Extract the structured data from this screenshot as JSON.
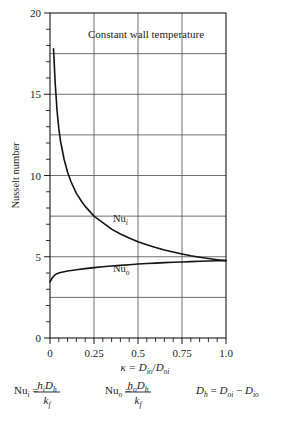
{
  "figure": {
    "annotation": "Constant wall temperature",
    "y_axis_title": "Nusselt number",
    "x_axis_caption": {
      "symbol": "κ",
      "equals": "=",
      "numerator": "D",
      "numerator_sub": "io",
      "slash": "/",
      "denominator": "D",
      "denominator_sub": "oi"
    },
    "curve_labels": {
      "inner": "Nu",
      "inner_sub": "i",
      "outer": "Nu",
      "outer_sub": "o"
    },
    "formulas": [
      {
        "lhs": "Nu",
        "lhs_sub": "i",
        "eq": "=",
        "num_a": "h",
        "num_a_sub": "i",
        "num_b": "D",
        "num_b_sub": "h",
        "den": "k",
        "den_sub": "f"
      },
      {
        "lhs": "Nu",
        "lhs_sub": "o",
        "eq": "=",
        "num_a": "h",
        "num_a_sub": "o",
        "num_b": "D",
        "num_b_sub": "h",
        "den": "k",
        "den_sub": "f"
      }
    ],
    "hydraulic_formula": {
      "lhs": "D",
      "lhs_sub": "h",
      "eq": "=",
      "term1": "D",
      "term1_sub": "oi",
      "minus": "−",
      "term2": "D",
      "term2_sub": "io"
    }
  },
  "chart_data": {
    "type": "line",
    "title": "",
    "annotation": "Constant wall temperature",
    "xlabel": "κ = D_io/D_oi",
    "ylabel": "Nusselt number",
    "xlim": [
      0,
      1.0
    ],
    "ylim": [
      0,
      20
    ],
    "xticks": [
      0,
      0.25,
      0.5,
      0.75,
      1.0
    ],
    "xtick_labels": [
      "0",
      "0.25",
      "0.5",
      "0.75",
      "1.0"
    ],
    "yticks": [
      0,
      5,
      10,
      15,
      20
    ],
    "ytick_labels": [
      "0",
      "5",
      "10",
      "15",
      "20"
    ],
    "x_minor_tick_step": 0.05,
    "y_minor_tick_step": 1,
    "grid": true,
    "grid_x_values": [
      0.25,
      0.5,
      0.75
    ],
    "grid_y_values": [
      2.5,
      5,
      7.5,
      10,
      12.5,
      15,
      17.5
    ],
    "legend_position": "inline-labels",
    "series": [
      {
        "name": "Nu_i",
        "label": "Nu",
        "label_sub": "i",
        "x": [
          0.02,
          0.03,
          0.04,
          0.05,
          0.06,
          0.08,
          0.1,
          0.12,
          0.15,
          0.18,
          0.2,
          0.25,
          0.3,
          0.35,
          0.4,
          0.45,
          0.5,
          0.55,
          0.6,
          0.65,
          0.7,
          0.75,
          0.8,
          0.85,
          0.9,
          0.95,
          1.0
        ],
        "y": [
          17.8,
          15.6,
          14.0,
          12.9,
          12.1,
          11.0,
          10.2,
          9.6,
          8.9,
          8.4,
          8.1,
          7.5,
          7.1,
          6.7,
          6.4,
          6.15,
          5.93,
          5.74,
          5.57,
          5.42,
          5.29,
          5.17,
          5.06,
          4.97,
          4.89,
          4.82,
          4.76
        ]
      },
      {
        "name": "Nu_o",
        "label": "Nu",
        "label_sub": "o",
        "x": [
          0.0,
          0.01,
          0.02,
          0.03,
          0.04,
          0.05,
          0.06,
          0.08,
          0.1,
          0.15,
          0.2,
          0.25,
          0.3,
          0.35,
          0.4,
          0.45,
          0.5,
          0.55,
          0.6,
          0.65,
          0.7,
          0.75,
          0.8,
          0.85,
          0.9,
          0.95,
          1.0
        ],
        "y": [
          3.45,
          3.65,
          3.8,
          3.9,
          3.96,
          4.0,
          4.03,
          4.08,
          4.12,
          4.2,
          4.27,
          4.33,
          4.38,
          4.43,
          4.47,
          4.51,
          4.55,
          4.58,
          4.61,
          4.64,
          4.66,
          4.68,
          4.7,
          4.72,
          4.74,
          4.75,
          4.76
        ]
      }
    ]
  }
}
